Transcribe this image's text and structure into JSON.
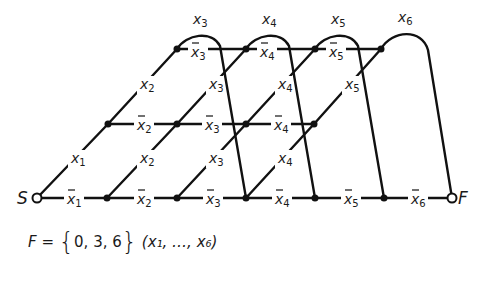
{
  "diagram": {
    "start_label": "S",
    "final_label": "F",
    "caption": {
      "lhs": "F",
      "equals": "=",
      "set_open": "{",
      "set_values": "0, 3, 6",
      "set_close": "}",
      "args": "(x₁, …, x₆)"
    },
    "colors": {
      "line": "#111111",
      "node": "#111111",
      "background": "#ffffff"
    },
    "rows": {
      "bottom": {
        "y": 198,
        "nodes_x": [
          37,
          107,
          177,
          246,
          315,
          384,
          452
        ]
      },
      "middle": {
        "y": 124,
        "nodes_x": [
          108,
          177,
          246,
          314
        ]
      },
      "top": {
        "y": 49,
        "nodes_x": [
          177,
          246,
          315,
          381
        ]
      }
    },
    "horizontal_labels": {
      "bottom": [
        "x̄1",
        "x̄2",
        "x̄3",
        "x̄4",
        "x̄5",
        "x̄6"
      ],
      "middle": [
        "x̄2",
        "x̄3",
        "x̄4"
      ],
      "top": [
        "x̄3",
        "x̄4",
        "x̄5"
      ]
    },
    "diagonal_labels": {
      "lower": [
        "x1",
        "x2",
        "x3",
        "x4"
      ],
      "upper": [
        "x2",
        "x3",
        "x4",
        "x5"
      ]
    },
    "arc_labels": [
      "x3",
      "x4",
      "x5",
      "x6"
    ]
  }
}
